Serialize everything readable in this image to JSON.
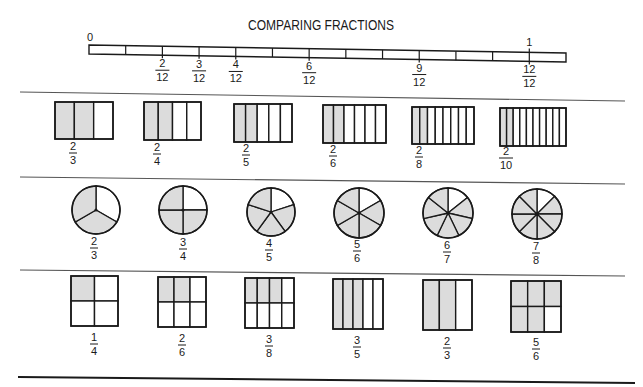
{
  "title": "COMPARING FRACTIONS",
  "colors": {
    "ink": "#1a1a1a",
    "shade": "#dcdcdc",
    "paper": "#ffffff",
    "separator": "#555555"
  },
  "number_line": {
    "start_label": "0",
    "end_label": "1",
    "segments": 13,
    "x_start": 89,
    "x_end": 566,
    "y_left_top": 45,
    "y_right_top": 53,
    "height": 9,
    "labels": [
      {
        "tick": 2,
        "numerator": "2",
        "denominator": "12"
      },
      {
        "tick": 3,
        "numerator": "3",
        "denominator": "12"
      },
      {
        "tick": 4,
        "numerator": "4",
        "denominator": "12"
      },
      {
        "tick": 6,
        "numerator": "6",
        "denominator": "12"
      },
      {
        "tick": 9,
        "numerator": "9",
        "denominator": "12"
      },
      {
        "tick": 12,
        "numerator": "12",
        "denominator": "12"
      }
    ]
  },
  "separators": [
    {
      "x1": 20,
      "y1": 92,
      "x2": 625,
      "y2": 101,
      "kind": "sep"
    },
    {
      "x1": 20,
      "y1": 177,
      "x2": 625,
      "y2": 184,
      "kind": "sep"
    },
    {
      "x1": 20,
      "y1": 270,
      "x2": 625,
      "y2": 276,
      "kind": "sep"
    },
    {
      "x1": 18,
      "y1": 377,
      "x2": 635,
      "y2": 383,
      "kind": "sep-bottom"
    }
  ],
  "bar_row": {
    "items": [
      {
        "x": 55,
        "y": 102,
        "w": 58,
        "h": 37,
        "parts": 3,
        "shaded": 2,
        "numerator": "2",
        "denominator": "3",
        "label_x": 73,
        "label_y": 150
      },
      {
        "x": 144,
        "y": 102,
        "w": 57,
        "h": 38,
        "parts": 4,
        "shaded": 2,
        "numerator": "2",
        "denominator": "4",
        "label_x": 157,
        "label_y": 151
      },
      {
        "x": 234,
        "y": 104,
        "w": 58,
        "h": 38,
        "parts": 5,
        "shaded": 2,
        "numerator": "2",
        "denominator": "5",
        "label_x": 246,
        "label_y": 152
      },
      {
        "x": 323,
        "y": 105,
        "w": 63,
        "h": 38,
        "parts": 6,
        "shaded": 2,
        "numerator": "2",
        "denominator": "6",
        "label_x": 333,
        "label_y": 153
      },
      {
        "x": 412,
        "y": 107,
        "w": 62,
        "h": 37,
        "parts": 8,
        "shaded": 2,
        "numerator": "2",
        "denominator": "8",
        "label_x": 419,
        "label_y": 154
      },
      {
        "x": 500,
        "y": 108,
        "w": 66,
        "h": 38,
        "parts": 10,
        "shaded": 2,
        "numerator": "2",
        "denominator": "10",
        "label_x": 506,
        "label_y": 155
      }
    ]
  },
  "circle_row": {
    "items": [
      {
        "cx": 96,
        "cy": 210,
        "r": 24,
        "parts": 3,
        "shaded": 2,
        "numerator": "2",
        "denominator": "3",
        "label_x": 94,
        "label_y": 245
      },
      {
        "cx": 183,
        "cy": 210,
        "r": 24,
        "parts": 4,
        "shaded": 3,
        "numerator": "3",
        "denominator": "4",
        "label_x": 183,
        "label_y": 246
      },
      {
        "cx": 271,
        "cy": 212,
        "r": 24,
        "parts": 5,
        "shaded": 4,
        "numerator": "4",
        "denominator": "5",
        "label_x": 269,
        "label_y": 247
      },
      {
        "cx": 359,
        "cy": 213,
        "r": 25,
        "parts": 6,
        "shaded": 5,
        "numerator": "5",
        "denominator": "6",
        "label_x": 357,
        "label_y": 248
      },
      {
        "cx": 448,
        "cy": 213,
        "r": 25,
        "parts": 7,
        "shaded": 6,
        "numerator": "6",
        "denominator": "7",
        "label_x": 447,
        "label_y": 249
      },
      {
        "cx": 537,
        "cy": 214,
        "r": 25,
        "parts": 8,
        "shaded": 7,
        "numerator": "7",
        "denominator": "8",
        "label_x": 536,
        "label_y": 250
      }
    ]
  },
  "grid_row": {
    "items": [
      {
        "x": 71,
        "y": 276,
        "w": 47,
        "h": 50,
        "cols": 2,
        "rows": 2,
        "shaded": 1,
        "numerator": "1",
        "denominator": "4",
        "label_x": 94,
        "label_y": 341
      },
      {
        "x": 158,
        "y": 277,
        "w": 48,
        "h": 50,
        "cols": 3,
        "rows": 2,
        "shaded": 2,
        "numerator": "2",
        "denominator": "6",
        "label_x": 182,
        "label_y": 342
      },
      {
        "x": 245,
        "y": 278,
        "w": 49,
        "h": 50,
        "cols": 4,
        "rows": 2,
        "shaded": 3,
        "numerator": "3",
        "denominator": "8",
        "label_x": 269,
        "label_y": 343
      },
      {
        "x": 333,
        "y": 279,
        "w": 50,
        "h": 50,
        "cols": 5,
        "rows": 1,
        "shaded": 3,
        "numerator": "3",
        "denominator": "5",
        "label_x": 357,
        "label_y": 344
      },
      {
        "x": 423,
        "y": 280,
        "w": 49,
        "h": 50,
        "cols": 3,
        "rows": 1,
        "shaded": 2,
        "numerator": "2",
        "denominator": "3",
        "label_x": 447,
        "label_y": 345
      },
      {
        "x": 511,
        "y": 281,
        "w": 50,
        "h": 51,
        "cols": 3,
        "rows": 2,
        "shaded": 5,
        "numerator": "5",
        "denominator": "6",
        "label_x": 536,
        "label_y": 346
      }
    ]
  }
}
